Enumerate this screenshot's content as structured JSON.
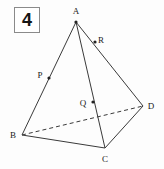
{
  "figure": {
    "problem_number": "4",
    "shape_name": "pyramid",
    "vertex_labels": [
      "A",
      "B",
      "C",
      "D"
    ],
    "marked_point_labels": [
      "P",
      "Q",
      "R"
    ],
    "points": {
      "A": {
        "label": "A",
        "x": 76,
        "y": 22,
        "label_x": 76,
        "label_y": 14
      },
      "B": {
        "label": "B",
        "x": 22,
        "y": 135,
        "label_x": 13,
        "label_y": 138
      },
      "C": {
        "label": "C",
        "x": 105,
        "y": 148,
        "label_x": 105,
        "label_y": 162
      },
      "D": {
        "label": "D",
        "x": 143,
        "y": 106,
        "label_x": 151,
        "label_y": 109
      },
      "P": {
        "label": "P",
        "x": 49,
        "y": 78,
        "label_x": 40,
        "label_y": 78
      },
      "Q": {
        "label": "Q",
        "x": 93,
        "y": 102,
        "label_x": 83,
        "label_y": 106
      },
      "R": {
        "label": "R",
        "x": 95,
        "y": 42,
        "label_x": 101,
        "label_y": 43
      }
    },
    "edges": [
      {
        "name": "edge-A-B",
        "from": "A",
        "to": "B",
        "style": "solid"
      },
      {
        "name": "edge-A-C",
        "from": "A",
        "to": "C",
        "style": "solid"
      },
      {
        "name": "edge-A-D",
        "from": "A",
        "to": "D",
        "style": "solid"
      },
      {
        "name": "edge-B-C",
        "from": "B",
        "to": "C",
        "style": "solid"
      },
      {
        "name": "edge-C-D",
        "from": "C",
        "to": "D",
        "style": "solid"
      },
      {
        "name": "edge-B-D",
        "from": "B",
        "to": "D",
        "style": "dashed"
      }
    ],
    "colors": {
      "line": "#3a3a3a",
      "dot": "#222222",
      "label": "#1a1a1a",
      "box_border": "#8a8a8a",
      "background": "#fdfdfd"
    }
  }
}
